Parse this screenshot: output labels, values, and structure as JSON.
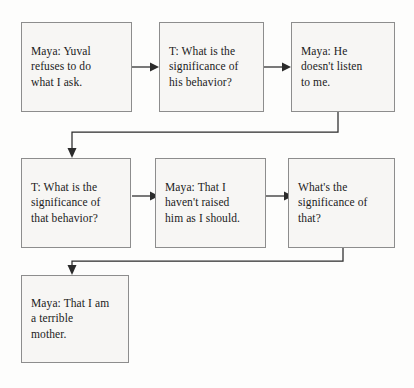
{
  "diagram": {
    "type": "flowchart",
    "background_color": "#fdfdfc",
    "node_fill_color": "#f7f6f4",
    "node_border_color": "#8d8d8d",
    "connector_color": "#2b2b2b",
    "text_color": "#1b1b1b",
    "nodes": [
      {
        "id": "n1",
        "text": "Maya: Yuval\nrefuses to do\nwhat I ask.",
        "speaker": "Maya",
        "row": 1,
        "column": 1
      },
      {
        "id": "n2",
        "text": "T:  What is the\nsignificance of\nhis behavior?",
        "speaker": "T",
        "row": 1,
        "column": 2
      },
      {
        "id": "n3",
        "text": "Maya: He\ndoesn't listen\nto me.",
        "speaker": "Maya",
        "row": 1,
        "column": 3
      },
      {
        "id": "n4",
        "text": "T: What is the\nsignificance of\nthat behavior?",
        "speaker": "T",
        "row": 2,
        "column": 1
      },
      {
        "id": "n5",
        "text": "Maya: That I\nhaven't raised\nhim as I should.",
        "speaker": "Maya",
        "row": 2,
        "column": 2
      },
      {
        "id": "n6",
        "text": "What's the\nsignificance of\nthat?",
        "speaker": "",
        "row": 2,
        "column": 3
      },
      {
        "id": "n7",
        "text": "Maya: That I am\na terrible\nmother.",
        "speaker": "Maya",
        "row": 3,
        "column": 1
      }
    ],
    "edges": [
      {
        "id": "e1",
        "from": "n1",
        "to": "n2",
        "style": "straight-right"
      },
      {
        "id": "e2",
        "from": "n2",
        "to": "n3",
        "style": "straight-right"
      },
      {
        "id": "e3",
        "from": "n3",
        "to": "n4",
        "style": "elbow-wrap-left"
      },
      {
        "id": "e4",
        "from": "n4",
        "to": "n5",
        "style": "straight-right"
      },
      {
        "id": "e5",
        "from": "n5",
        "to": "n6",
        "style": "straight-right"
      },
      {
        "id": "e6",
        "from": "n6",
        "to": "n7",
        "style": "elbow-wrap-left"
      }
    ]
  }
}
